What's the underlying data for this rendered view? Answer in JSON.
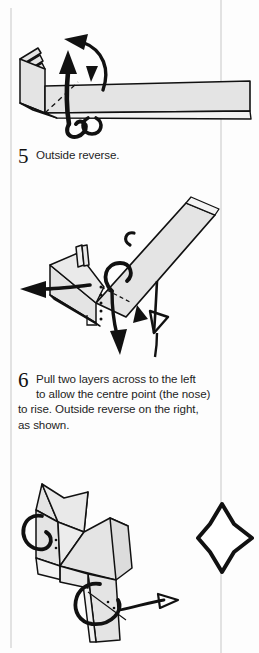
{
  "page": {
    "kind": "origami-instruction-page",
    "background_color": "#fdfdfd",
    "paper_fill": "#e4e4e4",
    "ink_color": "#111111",
    "rule_color": "#e2e2e2"
  },
  "steps": [
    {
      "number": "5",
      "lines": [
        "Outside reverse."
      ],
      "text": "Outside reverse."
    },
    {
      "number": "6",
      "lines": [
        "Pull two layers across to the left",
        "to allow the centre point (the nose)",
        "to rise. Outside reverse on the right,",
        "as shown."
      ],
      "text": "Pull two layers across to the left to allow the centre point (the nose) to rise. Outside reverse on the right, as shown."
    }
  ],
  "figures": [
    {
      "id": "figure-step-5",
      "caption_for_step": "5",
      "description": "Long horizontal folded strip with pleated layered end at the left, a dashed valley fold line, a thick straight arrow pointing up, a curved arrow sweeping up and left, and a looping wrap-around arrow below the strip."
    },
    {
      "id": "figure-step-6",
      "caption_for_step": "6",
      "description": "Diagonal folded strip rising to the upper right with a box-shaped layered section at the left, a solid arrow pointing left, a dotted fold line with a right-angle marker, a loop arrow around the strip, a solid arrow pointing down and a hollow outline push arrow."
    },
    {
      "id": "figure-result",
      "caption_for_step": "6",
      "description": "Resulting folded cat-like figure with two pointed ears, a nose point, body and tail, with loop arrows at the head and body and a small arrow pointing right."
    }
  ],
  "symbols": [
    {
      "id": "four-pointed-star",
      "name": "repeat-symbol",
      "description": "Four-pointed star outline symbol at the right of the result figure."
    }
  ]
}
